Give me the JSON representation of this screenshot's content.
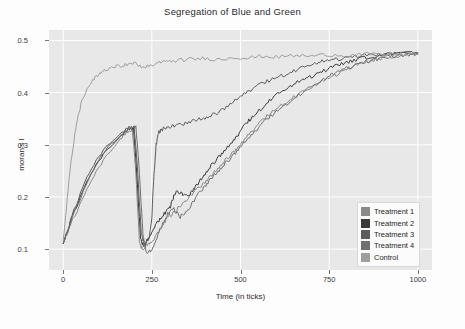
{
  "chart_data": {
    "type": "line",
    "title": "Segregation of Blue and Green",
    "xlabel": "Time (in ticks)",
    "ylabel": "moran's I",
    "xlim": [
      -40,
      1040
    ],
    "ylim": [
      0.06,
      0.52
    ],
    "xticks": [
      0,
      250,
      500,
      750,
      1000
    ],
    "xtick_labels": [
      "0",
      "250",
      "500",
      "750",
      "1000"
    ],
    "yticks": [
      0.1,
      0.2,
      0.3,
      0.4,
      0.5
    ],
    "ytick_labels": [
      "0.1",
      "0.2",
      "0.3",
      "0.4",
      "0.5"
    ],
    "grid": true,
    "grid_color": "#ffffff",
    "plot_bg": "#e8e8e8",
    "legend_position": "lower right",
    "series": [
      {
        "name": "Treatment 1",
        "color": "#8a8a8a",
        "x": [
          0,
          20,
          60,
          100,
          140,
          170,
          195,
          205,
          215,
          225,
          240,
          255,
          270,
          285,
          300,
          320,
          340,
          360,
          380,
          400,
          420,
          440,
          460,
          480,
          500,
          520,
          545,
          570,
          600,
          630,
          660,
          690,
          720,
          750,
          780,
          810,
          840,
          870,
          900,
          930,
          960,
          1000
        ],
        "y": [
          0.113,
          0.145,
          0.205,
          0.255,
          0.295,
          0.318,
          0.33,
          0.245,
          0.112,
          0.098,
          0.112,
          0.118,
          0.134,
          0.152,
          0.163,
          0.175,
          0.19,
          0.203,
          0.216,
          0.228,
          0.243,
          0.258,
          0.272,
          0.286,
          0.3,
          0.318,
          0.335,
          0.352,
          0.368,
          0.382,
          0.396,
          0.406,
          0.418,
          0.428,
          0.438,
          0.448,
          0.456,
          0.462,
          0.466,
          0.47,
          0.472,
          0.474
        ]
      },
      {
        "name": "Treatment 2",
        "color": "#3a3a3a",
        "x": [
          0,
          25,
          60,
          100,
          140,
          175,
          198,
          208,
          218,
          228,
          240,
          255,
          270,
          285,
          300,
          310,
          320,
          335,
          350,
          365,
          380,
          400,
          420,
          440,
          460,
          480,
          500,
          520,
          540,
          565,
          590,
          620,
          650,
          680,
          710,
          740,
          770,
          800,
          830,
          860,
          900,
          940,
          1000
        ],
        "y": [
          0.113,
          0.16,
          0.22,
          0.268,
          0.303,
          0.325,
          0.334,
          0.24,
          0.12,
          0.104,
          0.122,
          0.14,
          0.155,
          0.168,
          0.178,
          0.198,
          0.212,
          0.206,
          0.2,
          0.212,
          0.226,
          0.245,
          0.262,
          0.278,
          0.292,
          0.308,
          0.326,
          0.344,
          0.356,
          0.374,
          0.39,
          0.404,
          0.416,
          0.426,
          0.434,
          0.443,
          0.452,
          0.459,
          0.464,
          0.468,
          0.472,
          0.474,
          0.476
        ]
      },
      {
        "name": "Treatment 3",
        "color": "#5c5c5c",
        "x": [
          0,
          25,
          60,
          100,
          140,
          178,
          200,
          210,
          220,
          230,
          242,
          250,
          255,
          262,
          270,
          280,
          295,
          310,
          330,
          350,
          375,
          400,
          425,
          450,
          480,
          510,
          540,
          570,
          600,
          630,
          660,
          690,
          720,
          750,
          790,
          830,
          870,
          910,
          950,
          1000
        ],
        "y": [
          0.113,
          0.163,
          0.228,
          0.276,
          0.31,
          0.33,
          0.336,
          0.25,
          0.13,
          0.108,
          0.122,
          0.16,
          0.232,
          0.3,
          0.324,
          0.33,
          0.334,
          0.336,
          0.338,
          0.342,
          0.348,
          0.352,
          0.358,
          0.368,
          0.382,
          0.398,
          0.41,
          0.42,
          0.428,
          0.436,
          0.444,
          0.452,
          0.458,
          0.462,
          0.466,
          0.47,
          0.472,
          0.474,
          0.475,
          0.476
        ]
      },
      {
        "name": "Treatment 4",
        "color": "#707070",
        "x": [
          0,
          30,
          70,
          110,
          150,
          185,
          205,
          215,
          225,
          235,
          248,
          262,
          278,
          295,
          312,
          330,
          348,
          366,
          384,
          402,
          420,
          440,
          460,
          482,
          505,
          530,
          555,
          580,
          610,
          640,
          675,
          710,
          745,
          780,
          820,
          860,
          900,
          950,
          1000
        ],
        "y": [
          0.113,
          0.168,
          0.232,
          0.28,
          0.312,
          0.33,
          0.336,
          0.246,
          0.126,
          0.092,
          0.098,
          0.118,
          0.145,
          0.168,
          0.176,
          0.162,
          0.172,
          0.19,
          0.208,
          0.222,
          0.238,
          0.252,
          0.266,
          0.282,
          0.3,
          0.318,
          0.336,
          0.352,
          0.368,
          0.384,
          0.4,
          0.416,
          0.43,
          0.442,
          0.452,
          0.46,
          0.466,
          0.472,
          0.475
        ]
      },
      {
        "name": "Control",
        "color": "#9e9e9e",
        "x": [
          0,
          10,
          20,
          35,
          50,
          70,
          90,
          110,
          130,
          150,
          175,
          200,
          225,
          250,
          275,
          300,
          330,
          360,
          400,
          440,
          480,
          520,
          560,
          600,
          650,
          700,
          750,
          800,
          850,
          900,
          950,
          1000
        ],
        "y": [
          0.113,
          0.185,
          0.258,
          0.33,
          0.378,
          0.41,
          0.428,
          0.44,
          0.448,
          0.452,
          0.453,
          0.456,
          0.449,
          0.452,
          0.458,
          0.461,
          0.462,
          0.464,
          0.466,
          0.463,
          0.468,
          0.466,
          0.47,
          0.468,
          0.471,
          0.47,
          0.473,
          0.471,
          0.474,
          0.472,
          0.474,
          0.473
        ]
      }
    ]
  },
  "legend": {
    "items": [
      {
        "label": "Treatment 1",
        "color": "#8a8a8a"
      },
      {
        "label": "Treatment 2",
        "color": "#3a3a3a"
      },
      {
        "label": "Treatment 3",
        "color": "#5c5c5c"
      },
      {
        "label": "Treatment 4",
        "color": "#707070"
      },
      {
        "label": "Control",
        "color": "#9e9e9e"
      }
    ]
  }
}
